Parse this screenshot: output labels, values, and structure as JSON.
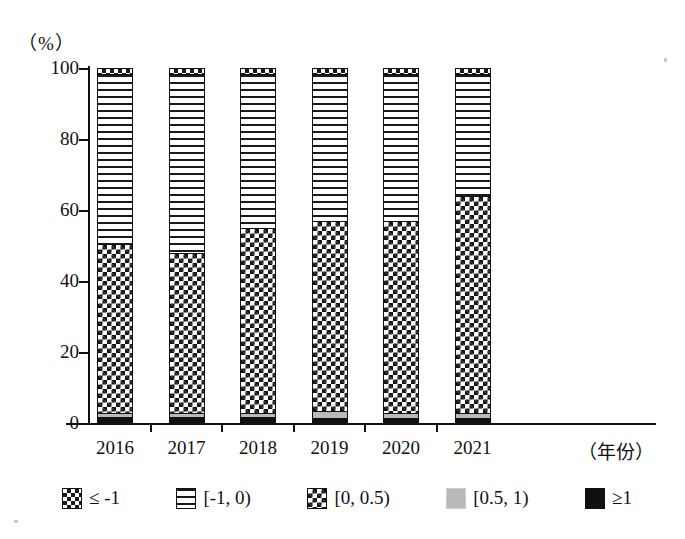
{
  "axes": {
    "y_unit_label": "（%）",
    "y_ticks": [
      "100",
      "80",
      "60",
      "40",
      "20",
      "0"
    ],
    "x_axis_title": "（年份）"
  },
  "legend": {
    "items": [
      {
        "label": "≤ -1",
        "pattern": "open-diamond",
        "color": "#1a1a1a"
      },
      {
        "label": "[-1, 0)",
        "pattern": "horizontal-stripes",
        "color": "#1a1a1a"
      },
      {
        "label": "[0, 0.5)",
        "pattern": "checkerboard",
        "color": "#141414"
      },
      {
        "label": "[0.5, 1)",
        "pattern": "solid-light-gray",
        "color": "#b9b9b9"
      },
      {
        "label": "≥1",
        "pattern": "solid-black",
        "color": "#101010"
      }
    ]
  },
  "chart_data": {
    "type": "bar",
    "title": "",
    "subtitle": "",
    "stacked": true,
    "stack_mode": "percent",
    "xlabel": "（年份）",
    "ylabel": "（%）",
    "ylim": [
      0,
      100
    ],
    "yticks": [
      0,
      20,
      40,
      60,
      80,
      100
    ],
    "grid": false,
    "legend_position": "bottom",
    "categories": [
      "2016",
      "2017",
      "2018",
      "2019",
      "2020",
      "2021"
    ],
    "series": [
      {
        "name": "≥1",
        "values": [
          1.5,
          1.3,
          1.3,
          1.2,
          1.0,
          1.0
        ]
      },
      {
        "name": "[0.5, 1)",
        "values": [
          1.0,
          1.2,
          1.2,
          1.8,
          1.5,
          1.5
        ]
      },
      {
        "name": "[0, 0.5)",
        "values": [
          48.0,
          45.5,
          52.5,
          54.0,
          54.5,
          61.5
        ]
      },
      {
        "name": "[-1, 0)",
        "values": [
          48.0,
          50.5,
          43.5,
          41.5,
          41.5,
          34.5
        ]
      },
      {
        "name": "≤ -1",
        "values": [
          1.5,
          1.5,
          1.5,
          1.5,
          1.5,
          1.5
        ]
      }
    ],
    "cumulative_tops": {
      "note": "top of [0, 0.5) segment per year, in percent",
      "values": [
        50.5,
        48.0,
        55.0,
        57.0,
        57.0,
        64.0
      ]
    }
  },
  "bars": [
    {
      "year": "2016",
      "segments": [
        {
          "key": "le1",
          "pct": 1.5
        },
        {
          "key": "m10",
          "pct": 48.0
        },
        {
          "key": "p005",
          "pct": 48.0
        },
        {
          "key": "p051",
          "pct": 1.0
        },
        {
          "key": "ge1",
          "pct": 1.5
        }
      ]
    },
    {
      "year": "2017",
      "segments": [
        {
          "key": "le1",
          "pct": 1.5
        },
        {
          "key": "m10",
          "pct": 50.5
        },
        {
          "key": "p005",
          "pct": 45.5
        },
        {
          "key": "p051",
          "pct": 1.2
        },
        {
          "key": "ge1",
          "pct": 1.3
        }
      ]
    },
    {
      "year": "2018",
      "segments": [
        {
          "key": "le1",
          "pct": 1.5
        },
        {
          "key": "m10",
          "pct": 43.5
        },
        {
          "key": "p005",
          "pct": 52.5
        },
        {
          "key": "p051",
          "pct": 1.2
        },
        {
          "key": "ge1",
          "pct": 1.3
        }
      ]
    },
    {
      "year": "2019",
      "segments": [
        {
          "key": "le1",
          "pct": 1.5
        },
        {
          "key": "m10",
          "pct": 41.5
        },
        {
          "key": "p005",
          "pct": 54.0
        },
        {
          "key": "p051",
          "pct": 1.8
        },
        {
          "key": "ge1",
          "pct": 1.2
        }
      ]
    },
    {
      "year": "2020",
      "segments": [
        {
          "key": "le1",
          "pct": 1.5
        },
        {
          "key": "m10",
          "pct": 41.5
        },
        {
          "key": "p005",
          "pct": 54.5
        },
        {
          "key": "p051",
          "pct": 1.5
        },
        {
          "key": "ge1",
          "pct": 1.0
        }
      ]
    },
    {
      "year": "2021",
      "segments": [
        {
          "key": "le1",
          "pct": 1.5
        },
        {
          "key": "m10",
          "pct": 34.5
        },
        {
          "key": "p005",
          "pct": 61.5
        },
        {
          "key": "p051",
          "pct": 1.5
        },
        {
          "key": "ge1",
          "pct": 1.0
        }
      ]
    }
  ]
}
